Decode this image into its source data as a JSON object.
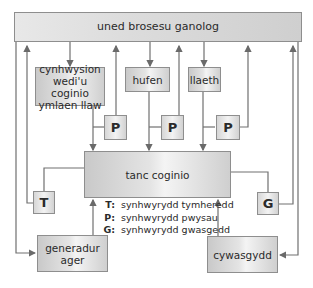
{
  "diagram": {
    "central_unit": "uned brosesu ganolog",
    "inputs": [
      {
        "id": "precooked",
        "label": "cynhwysion wedi'u coginio ymlaen llaw"
      },
      {
        "id": "cream",
        "label": "hufen"
      },
      {
        "id": "milk",
        "label": "llaeth"
      }
    ],
    "tank": "tanc coginio",
    "sensors": {
      "pressure_1": "P",
      "pressure_2": "P",
      "pressure_3": "P",
      "temperature": "T",
      "compression": "G"
    },
    "steam_generator": "generadur ager",
    "compressor": "cywasgydd",
    "legend": [
      {
        "key": "T:",
        "value": "synhwyrydd tymheredd"
      },
      {
        "key": "P:",
        "value": "synhwyrydd pwysau"
      },
      {
        "key": "G:",
        "value": "synhwyrydd gwasgedd"
      }
    ],
    "colors": {
      "line": "#707070",
      "box_border": "#8e8e8e",
      "box_fill": "#d8d8d8"
    }
  }
}
